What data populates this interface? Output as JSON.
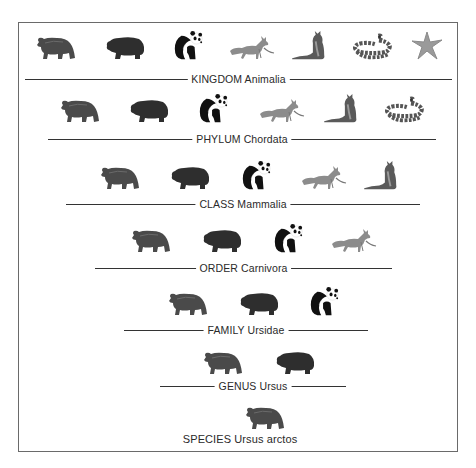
{
  "figure": {
    "ranks": [
      {
        "rank": "KINGDOM",
        "taxon": "Animalia",
        "label": "KINGDOM Animalia",
        "members": [
          "brown-bear",
          "black-bear",
          "giant-panda",
          "red-fox",
          "squirrel",
          "snake",
          "starfish"
        ]
      },
      {
        "rank": "PHYLUM",
        "taxon": "Chordata",
        "label": "PHYLUM Chordata",
        "members": [
          "brown-bear",
          "black-bear",
          "giant-panda",
          "red-fox",
          "squirrel",
          "snake"
        ]
      },
      {
        "rank": "CLASS",
        "taxon": "Mammalia",
        "label": "CLASS Mammalia",
        "members": [
          "brown-bear",
          "black-bear",
          "giant-panda",
          "red-fox",
          "squirrel"
        ]
      },
      {
        "rank": "ORDER",
        "taxon": "Carnivora",
        "label": "ORDER Carnivora",
        "members": [
          "brown-bear",
          "black-bear",
          "giant-panda",
          "red-fox"
        ]
      },
      {
        "rank": "FAMILY",
        "taxon": "Ursidae",
        "label": "FAMILY Ursidae",
        "members": [
          "brown-bear",
          "black-bear",
          "giant-panda"
        ]
      },
      {
        "rank": "GENUS",
        "taxon": "Ursus",
        "label": "GENUS Ursus",
        "members": [
          "brown-bear",
          "black-bear"
        ]
      },
      {
        "rank": "SPECIES",
        "taxon": "Ursus arctos",
        "label": "SPECIES Ursus arctos",
        "members": [
          "brown-bear"
        ]
      }
    ]
  },
  "colors": {
    "border": "#6a6a6a",
    "line": "#333333",
    "text": "#2a2a2a",
    "brown_bear": "#4a4a4a",
    "black_bear": "#2e2e2e",
    "panda": "#111111",
    "fox": "#8c8c8c",
    "squirrel": "#5a5a5a",
    "snake": "#555555",
    "starfish": "#9a9a9a"
  }
}
